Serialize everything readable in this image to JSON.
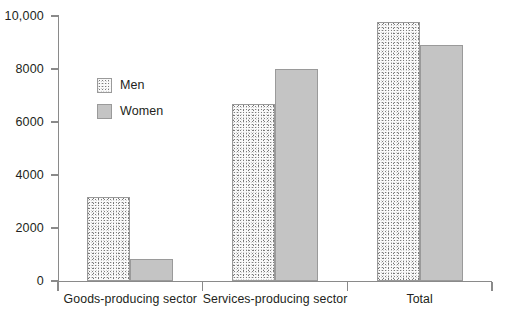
{
  "chart_data": {
    "type": "bar",
    "title": "",
    "subtitle": "",
    "xlabel": "",
    "ylabel": "",
    "categories": [
      "Goods-producing sector",
      "Services-producing sector",
      "Total"
    ],
    "series": [
      {
        "name": "Men",
        "values": [
          3170,
          6680,
          9770
        ]
      },
      {
        "name": "Women",
        "values": [
          830,
          8000,
          8920
        ]
      }
    ],
    "ylim": [
      0,
      10000
    ],
    "yticks": [
      0,
      2000,
      4000,
      6000,
      8000,
      10000
    ],
    "ytick_labels": [
      "0",
      "2000",
      "4000",
      "6000",
      "8000",
      "10,000"
    ],
    "grid": false,
    "legend_position": "upper-left-inside",
    "colors": {
      "men_fill": "#fbfbfb",
      "men_pattern": "stipple",
      "women_fill": "#c4c4c4",
      "bar_border": "#9a9a9a",
      "axis": "#8a8a8a",
      "text": "#231f20",
      "background": "#ffffff"
    }
  },
  "legend": {
    "items": [
      {
        "label": "Men",
        "swatch": "stippled-square-swatch"
      },
      {
        "label": "Women",
        "swatch": "gray-square-swatch"
      }
    ]
  }
}
